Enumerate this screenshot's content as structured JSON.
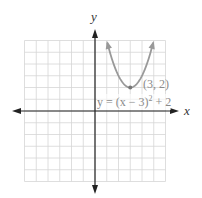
{
  "chart_data": {
    "type": "line",
    "title": "",
    "xlabel": "x",
    "ylabel": "y",
    "xlim": [
      -6,
      6
    ],
    "ylim": [
      -6,
      6
    ],
    "grid": true,
    "grid_step": 1,
    "series": [
      {
        "name": "y = (x − 3)² + 2",
        "function": "(x-3)^2+2",
        "x": [
          1.05,
          1.5,
          2,
          2.5,
          3,
          3.5,
          4,
          4.5,
          4.95
        ],
        "y": [
          5.8,
          4.25,
          3,
          2.25,
          2,
          2.25,
          3,
          4.25,
          5.8
        ],
        "arrows_at_ends": true,
        "color": "#999999"
      }
    ],
    "annotations": [
      {
        "text": "(3, 2)",
        "x": 3,
        "y": 2,
        "type": "vertex"
      },
      {
        "text": "y = (x − 3)² + 2",
        "type": "equation-label"
      }
    ]
  },
  "labels": {
    "x_axis": "x",
    "y_axis": "y",
    "vertex": "(3, 2)",
    "equation_prefix": "y = (x − 3)",
    "equation_exp": "2",
    "equation_suffix": " + 2"
  },
  "colors": {
    "grid": "#d6d6d6",
    "axis": "#222222",
    "curve": "#9a9a9a",
    "label": "#8a8a8a"
  }
}
